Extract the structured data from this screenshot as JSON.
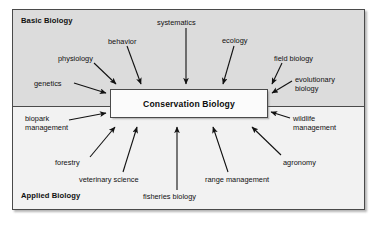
{
  "diagram": {
    "center_node": {
      "label": "Conservation Biology",
      "box": {
        "x": 110,
        "y": 89,
        "w": 158,
        "h": 29
      }
    },
    "zones": [
      {
        "id": "basic",
        "label": "Basic Biology",
        "fill": "#dcdcdc"
      },
      {
        "id": "applied",
        "label": "Applied Biology",
        "fill": "#f2f2f2"
      }
    ],
    "frame": {
      "x": 12,
      "y": 9,
      "w": 353,
      "h": 201,
      "border": "#4a4a4a"
    },
    "colors": {
      "frame_border": "#4a4a4a",
      "basic_fill": "#dcdcdc",
      "applied_fill": "#f2f2f2",
      "center_fill": "#fbfbfb",
      "arrow": "#111111",
      "text": "#111111",
      "page_background": "#ffffff"
    },
    "nodes": [
      {
        "id": "genetics",
        "label": "genetics",
        "zone": "basic",
        "x": 34,
        "y": 79,
        "arrow": {
          "x1": 74,
          "y1": 83,
          "x2": 106,
          "y2": 93
        }
      },
      {
        "id": "physiology",
        "label": "physiology",
        "zone": "basic",
        "x": 58,
        "y": 54,
        "arrow": {
          "x1": 94,
          "y1": 63,
          "x2": 116,
          "y2": 84
        }
      },
      {
        "id": "behavior",
        "label": "behavior",
        "zone": "basic",
        "x": 108,
        "y": 37,
        "arrow": {
          "x1": 127,
          "y1": 46,
          "x2": 141,
          "y2": 84
        }
      },
      {
        "id": "systematics",
        "label": "systematics",
        "zone": "basic",
        "x": 157,
        "y": 18,
        "arrow": {
          "x1": 186,
          "y1": 28,
          "x2": 186,
          "y2": 84
        }
      },
      {
        "id": "ecology",
        "label": "ecology",
        "zone": "basic",
        "x": 222,
        "y": 36,
        "arrow": {
          "x1": 234,
          "y1": 46,
          "x2": 223,
          "y2": 84
        }
      },
      {
        "id": "field-biology",
        "label": "field biology",
        "zone": "basic",
        "x": 274,
        "y": 54,
        "arrow": {
          "x1": 282,
          "y1": 63,
          "x2": 272,
          "y2": 84
        }
      },
      {
        "id": "evolutionary-biology",
        "label": "evolutionary\nbiology",
        "zone": "basic",
        "x": 295,
        "y": 75,
        "arrow": {
          "x1": 292,
          "y1": 81,
          "x2": 272,
          "y2": 93
        }
      },
      {
        "id": "biopark-management",
        "label": "biopark\nmanagement",
        "zone": "applied",
        "x": 25,
        "y": 114,
        "arrow": {
          "x1": 69,
          "y1": 120,
          "x2": 106,
          "y2": 113
        }
      },
      {
        "id": "forestry",
        "label": "forestry",
        "zone": "applied",
        "x": 55,
        "y": 158,
        "arrow": {
          "x1": 90,
          "y1": 157,
          "x2": 115,
          "y2": 127
        }
      },
      {
        "id": "veterinary-science",
        "label": "veterinary science",
        "zone": "applied",
        "x": 79,
        "y": 175,
        "arrow": {
          "x1": 123,
          "y1": 172,
          "x2": 137,
          "y2": 127
        }
      },
      {
        "id": "fisheries-biology",
        "label": "fisheries biology",
        "zone": "applied",
        "x": 143,
        "y": 192,
        "arrow": {
          "x1": 177,
          "y1": 190,
          "x2": 177,
          "y2": 127
        }
      },
      {
        "id": "range-management",
        "label": "range management",
        "zone": "applied",
        "x": 205,
        "y": 175,
        "arrow": {
          "x1": 228,
          "y1": 172,
          "x2": 213,
          "y2": 127
        }
      },
      {
        "id": "agronomy",
        "label": "agronomy",
        "zone": "applied",
        "x": 283,
        "y": 158,
        "arrow": {
          "x1": 281,
          "y1": 155,
          "x2": 252,
          "y2": 127
        }
      },
      {
        "id": "wildlife-management",
        "label": "wildlife\nmanagement",
        "zone": "applied",
        "x": 293,
        "y": 114,
        "arrow": {
          "x1": 290,
          "y1": 118,
          "x2": 271,
          "y2": 112
        }
      }
    ]
  }
}
